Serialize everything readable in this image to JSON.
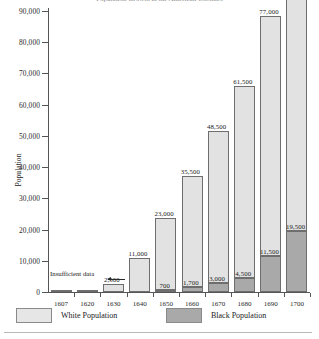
{
  "chart_data": {
    "type": "bar",
    "subtype": "stacked",
    "title": "Population Growth in the American Colonies",
    "xlabel": "",
    "ylabel": "Population",
    "ylim": [
      0,
      90000
    ],
    "ytick_step": 10000,
    "ytick_labels": [
      "0",
      "10,000",
      "20,000",
      "30,000",
      "40,000",
      "50,000",
      "60,000",
      "70,000",
      "80,000",
      "90,000"
    ],
    "grid": false,
    "legend_position": "bottom-left",
    "categories": [
      "1607",
      "1620",
      "1630",
      "1640",
      "1650",
      "1660",
      "1670",
      "1680",
      "1690",
      "1700"
    ],
    "series": [
      {
        "name": "White Population",
        "color": "#e2e2e2",
        "values": [
          null,
          null,
          2500,
          11000,
          23000,
          35500,
          48500,
          61500,
          77000,
          87500
        ],
        "labels": [
          "",
          "",
          "2,500",
          "11,000",
          "23,000",
          "35,500",
          "48,500",
          "61,500",
          "77,000",
          "87,500"
        ]
      },
      {
        "name": "Black Population",
        "color": "#a9a9a9",
        "values": [
          null,
          null,
          null,
          null,
          700,
          1700,
          3000,
          4500,
          11500,
          19500
        ],
        "labels": [
          "",
          "",
          "",
          "",
          "700",
          "1,700",
          "3,000",
          "4,500",
          "11,500",
          "19,500"
        ]
      }
    ],
    "annotations": [
      {
        "text": "Insufficient data",
        "note": "points to 1607 and 1620 columns"
      }
    ]
  },
  "axis": {
    "y_title": "Population",
    "y_ticks": [
      {
        "label": "90,000",
        "value": 90000
      },
      {
        "label": "80,000",
        "value": 80000
      },
      {
        "label": "70,000",
        "value": 70000
      },
      {
        "label": "60,000",
        "value": 60000
      },
      {
        "label": "50,000",
        "value": 50000
      },
      {
        "label": "40,000",
        "value": 40000
      },
      {
        "label": "30,000",
        "value": 30000
      },
      {
        "label": "20,000",
        "value": 20000
      },
      {
        "label": "10,000",
        "value": 10000
      },
      {
        "label": "0",
        "value": 0
      }
    ],
    "x_ticks": [
      "1607",
      "1620",
      "1630",
      "1640",
      "1650",
      "1660",
      "1670",
      "1680",
      "1690",
      "1700"
    ]
  },
  "legend": {
    "items": [
      {
        "label": "White Population",
        "color": "#e6e6e6"
      },
      {
        "label": "Black Population",
        "color": "#a9a9a9"
      }
    ]
  },
  "annotation": {
    "insufficient_data": "Insufficient data"
  },
  "bar_labels": {
    "white": [
      "",
      "",
      "2,500",
      "11,000",
      "23,000",
      "35,500",
      "48,500",
      "61,500",
      "77,000",
      "87,500"
    ],
    "black": [
      "",
      "",
      "",
      "",
      "700",
      "1,700",
      "3,000",
      "4,500",
      "11,500",
      "19,500"
    ]
  },
  "title": {
    "text": "Population Growth in the American Colonies"
  }
}
